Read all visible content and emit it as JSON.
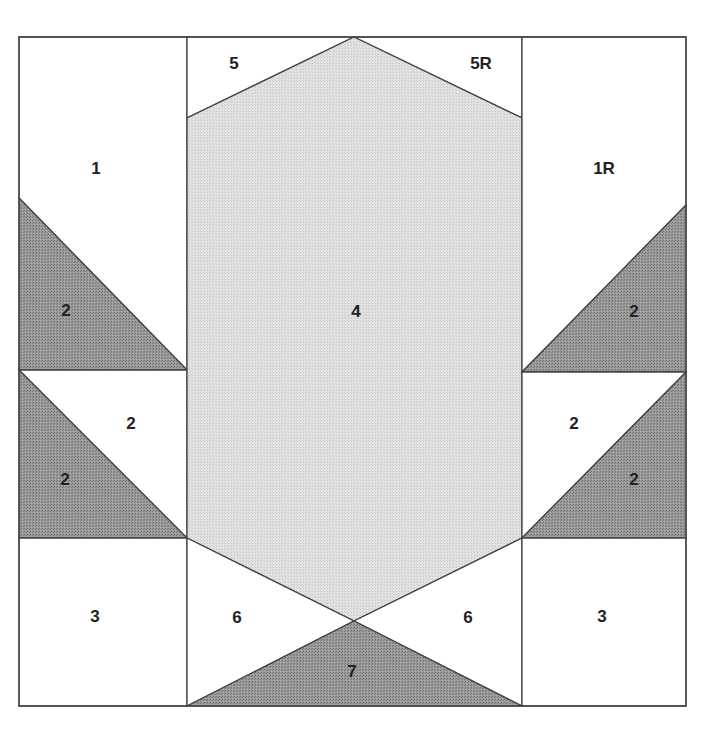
{
  "diagram": {
    "colors": {
      "background": "#ffffff",
      "light_fabric": "#d9d9d9",
      "dark_fabric": "#8c8c8c",
      "outline": "#444444",
      "label": "#222222"
    },
    "pieces": [
      {
        "id": "p1",
        "label": "1",
        "fill": "white",
        "points": "19,37 187,37 187,370 19,198",
        "label_pos": [
          96,
          168
        ]
      },
      {
        "id": "p2a",
        "label": "2",
        "fill": "dark",
        "points": "19,198 187,370 19,370",
        "label_pos": [
          66,
          310
        ]
      },
      {
        "id": "p2b",
        "label": "2",
        "fill": "white",
        "points": "19,370 187,370 187,538",
        "label_pos": [
          131,
          423
        ]
      },
      {
        "id": "p2c",
        "label": "2",
        "fill": "dark",
        "points": "19,370 187,538 19,538",
        "label_pos": [
          65,
          479
        ]
      },
      {
        "id": "p3l",
        "label": "3",
        "fill": "white",
        "points": "19,538 187,538 187,706 19,706",
        "label_pos": [
          95,
          616
        ]
      },
      {
        "id": "p5",
        "label": "5",
        "fill": "white",
        "points": "187,37 354,37 187,118",
        "label_pos": [
          234,
          63
        ]
      },
      {
        "id": "p5r",
        "label": "5R",
        "fill": "white",
        "points": "354,37 522,37 522,118",
        "label_pos": [
          481,
          63
        ]
      },
      {
        "id": "p4",
        "label": "4",
        "fill": "light",
        "points": "354,37 522,118 522,538 354,621 187,538 187,118",
        "label_pos": [
          356,
          311
        ]
      },
      {
        "id": "p6l",
        "label": "6",
        "fill": "white",
        "points": "187,538 354,621 187,706",
        "label_pos": [
          237,
          617
        ]
      },
      {
        "id": "p6r",
        "label": "6",
        "fill": "white",
        "points": "522,538 522,706 354,621",
        "label_pos": [
          468,
          617
        ]
      },
      {
        "id": "p7",
        "label": "7",
        "fill": "dark",
        "points": "187,706 354,621 522,706",
        "label_pos": [
          352,
          671
        ]
      },
      {
        "id": "p1r",
        "label": "1R",
        "fill": "white",
        "points": "522,37 686,37 686,205 522,372",
        "label_pos": [
          604,
          168
        ]
      },
      {
        "id": "p2d",
        "label": "2",
        "fill": "dark",
        "points": "686,205 686,372 522,372",
        "label_pos": [
          634,
          311
        ]
      },
      {
        "id": "p2e",
        "label": "2",
        "fill": "white",
        "points": "522,372 686,372 522,538",
        "label_pos": [
          574,
          423
        ]
      },
      {
        "id": "p2f",
        "label": "2",
        "fill": "dark",
        "points": "686,372 686,538 522,538",
        "label_pos": [
          634,
          479
        ]
      },
      {
        "id": "p3r",
        "label": "3",
        "fill": "white",
        "points": "522,538 686,538 686,706 522,706",
        "label_pos": [
          602,
          616
        ]
      }
    ]
  }
}
